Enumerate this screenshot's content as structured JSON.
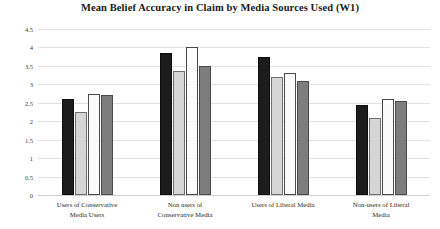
{
  "chart_data": {
    "type": "bar",
    "title": "Mean Belief Accuracy in Claim by Media Sources Used (W1)",
    "xlabel": "",
    "ylabel": "",
    "ylim": [
      0,
      4.5
    ],
    "ytick_step": 0.5,
    "yticks": [
      "0",
      "0.5",
      "1",
      "1.5",
      "2",
      "2.5",
      "3",
      "3.5",
      "4",
      "4.5"
    ],
    "ytick_values": [
      0,
      0.5,
      1,
      1.5,
      2,
      2.5,
      3,
      3.5,
      4,
      4.5
    ],
    "grid": true,
    "legend": "none",
    "categories": [
      "Users of Conservative Media Users",
      "Non users of Conservative Media",
      "Users of Liberal Media",
      "Non-users of Liberal Media"
    ],
    "category_lines": [
      [
        "Users of Conservative",
        "Media Users"
      ],
      [
        "Non users of",
        "Conservative Media"
      ],
      [
        "Users of Liberal Media",
        ""
      ],
      [
        "Non-users of Liberal",
        "Media"
      ]
    ],
    "series": [
      {
        "name": "Series 1",
        "color": "#1c1c1c",
        "values": [
          2.6,
          3.85,
          3.75,
          2.45
        ]
      },
      {
        "name": "Series 2",
        "color": "#d6d6d6",
        "values": [
          2.25,
          3.35,
          3.2,
          2.1
        ]
      },
      {
        "name": "Series 3",
        "color": "#fbfbfb",
        "values": [
          2.75,
          4.0,
          3.3,
          2.6
        ]
      },
      {
        "name": "Series 4",
        "color": "#7d7d7d",
        "values": [
          2.7,
          3.5,
          3.1,
          2.55
        ]
      }
    ]
  }
}
